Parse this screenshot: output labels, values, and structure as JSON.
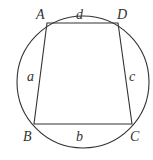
{
  "diagram": {
    "colors": {
      "stroke": "#333333",
      "background": "#ffffff"
    },
    "circle": {
      "cx": 83,
      "cy": 82,
      "r": 66
    },
    "vertices": [
      {
        "name": "A",
        "x": 47,
        "y": 23,
        "label_x": 36,
        "label_y": 19
      },
      {
        "name": "B",
        "x": 34,
        "y": 124,
        "label_x": 23,
        "label_y": 141
      },
      {
        "name": "C",
        "x": 132,
        "y": 124,
        "label_x": 130,
        "label_y": 141
      },
      {
        "name": "D",
        "x": 118,
        "y": 23,
        "label_x": 117,
        "label_y": 19
      }
    ],
    "sides": [
      {
        "name": "a",
        "from": "A",
        "to": "B",
        "label_x": 27,
        "label_y": 81
      },
      {
        "name": "b",
        "from": "B",
        "to": "C",
        "label_x": 76,
        "label_y": 141
      },
      {
        "name": "c",
        "from": "C",
        "to": "D",
        "label_x": 129,
        "label_y": 81
      },
      {
        "name": "d",
        "from": "D",
        "to": "A",
        "label_x": 76,
        "label_y": 19
      }
    ]
  }
}
